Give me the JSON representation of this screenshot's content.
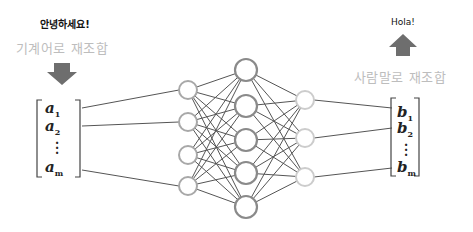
{
  "input": {
    "greeting": "안녕하세요!",
    "process_label": "기계어로 재조합",
    "arrow": "down-arrow",
    "vector": {
      "symbol": "a",
      "items": [
        "1",
        "2",
        "m"
      ]
    }
  },
  "output": {
    "greeting": "Hola!",
    "process_label": "사람말로 재조합",
    "arrow": "up-arrow",
    "vector": {
      "symbol": "b",
      "items": [
        "1",
        "2",
        "m"
      ]
    }
  },
  "network": {
    "layers": [
      {
        "name": "input-layer",
        "nodes": 4,
        "color": "#a8a8a8"
      },
      {
        "name": "hidden-layer",
        "nodes": 5,
        "color": "#8a8a8a"
      },
      {
        "name": "output-layer",
        "nodes": 3,
        "color": "#cccccc"
      }
    ],
    "edge_color": "#555555",
    "arrow_color": "#6e6e6e"
  }
}
